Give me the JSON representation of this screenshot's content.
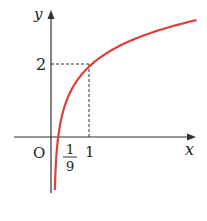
{
  "chart_data": {
    "type": "line",
    "title": "",
    "function": "y = 2 + log_3(x)",
    "xlabel": "x",
    "ylabel": "y",
    "origin_label": "O",
    "x_ticks": [
      {
        "value": 0.1111,
        "label_num": "1",
        "label_den": "9"
      },
      {
        "value": 1,
        "label": "1"
      }
    ],
    "y_ticks": [
      {
        "value": 2,
        "label": "2"
      }
    ],
    "marked_point": {
      "x": 1,
      "y": 2
    },
    "x_intercept": {
      "x": 0.1111,
      "y": 0
    },
    "series": [
      {
        "name": "curve",
        "color": "#e0403a",
        "x": [
          0.03,
          0.0625,
          0.1111,
          0.25,
          0.5,
          1,
          1.5,
          2,
          2.5,
          3,
          3.7
        ],
        "y": [
          -1.19,
          -0.52,
          0,
          0.74,
          1.37,
          2,
          2.37,
          2.63,
          2.83,
          3,
          3.19
        ]
      }
    ],
    "grid": false,
    "xlim": [
      -0.3,
      3.9
    ],
    "ylim": [
      -1.45,
      3.4
    ]
  }
}
